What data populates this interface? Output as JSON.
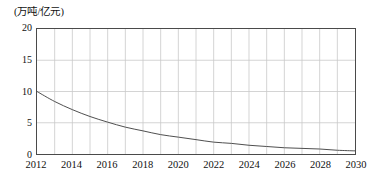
{
  "chart_data": {
    "type": "line",
    "title": "",
    "subtitle": "",
    "ylabel": "(万吨/亿元)",
    "xlabel": "",
    "ylim": [
      0,
      20
    ],
    "xlim": [
      2012,
      2030
    ],
    "yticks": [
      "0",
      "5",
      "10",
      "15",
      "20"
    ],
    "ytick_values": [
      0,
      5,
      10,
      15,
      20
    ],
    "xticks": [
      "2012",
      "2014",
      "2016",
      "2018",
      "2020",
      "2022",
      "2024",
      "2026",
      "2028",
      "2030"
    ],
    "xtick_values": [
      2012,
      2014,
      2016,
      2018,
      2020,
      2022,
      2024,
      2026,
      2028,
      2030
    ],
    "grid": true,
    "grid_x_step": 1,
    "grid_y_step": 5,
    "legend": null,
    "series": [
      {
        "name": "单位GDP能耗",
        "color": "#4d4d4d",
        "x": [
          2012,
          2013,
          2014,
          2015,
          2016,
          2017,
          2018,
          2019,
          2020,
          2021,
          2022,
          2023,
          2024,
          2025,
          2026,
          2027,
          2028,
          2029,
          2030
        ],
        "values": [
          10.0,
          8.4,
          7.1,
          6.0,
          5.1,
          4.3,
          3.7,
          3.1,
          2.7,
          2.3,
          1.9,
          1.7,
          1.4,
          1.2,
          1.0,
          0.9,
          0.8,
          0.6,
          0.5
        ]
      }
    ]
  },
  "axis": {
    "unit_caption": "(万吨/亿元)"
  },
  "style": {
    "frame_color": "#4a4a4a",
    "grid_color": "#c8c8c8",
    "series_color": "#4d4d4d",
    "background": "#ffffff",
    "text_color": "#111111"
  }
}
